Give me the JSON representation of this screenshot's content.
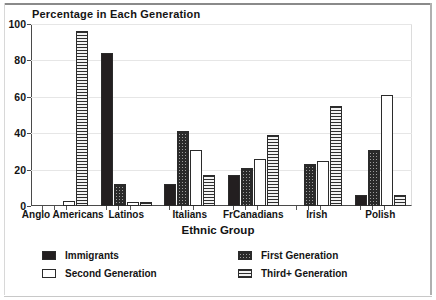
{
  "chart_data": {
    "type": "bar",
    "title": "Percentage in Each Generation",
    "xlabel": "Ethnic Group",
    "ylabel": "",
    "ylim": [
      0,
      100
    ],
    "yticks": [
      0,
      20,
      40,
      60,
      80,
      100
    ],
    "grid": true,
    "legend_position": "below",
    "categories": [
      "Anglo Americans",
      "Latinos",
      "Italians",
      "FrCanadians",
      "Irish",
      "Polish"
    ],
    "series": [
      {
        "name": "Immigrants",
        "pattern": "solid-black",
        "values": [
          0,
          84,
          12,
          17,
          0,
          6
        ]
      },
      {
        "name": "First Generation",
        "pattern": "checkered",
        "values": [
          0,
          12,
          41,
          21,
          23,
          31
        ]
      },
      {
        "name": "Second Generation",
        "pattern": "white-empty",
        "values": [
          3,
          2,
          31,
          26,
          25,
          61
        ]
      },
      {
        "name": "Third+ Generation",
        "pattern": "horizontal-lines",
        "values": [
          96,
          2,
          17,
          39,
          55,
          6
        ]
      }
    ]
  },
  "legend": {
    "entries": [
      {
        "label": "Immigrants"
      },
      {
        "label": "First Generation"
      },
      {
        "label": "Second Generation"
      },
      {
        "label": "Third+ Generation"
      }
    ]
  }
}
